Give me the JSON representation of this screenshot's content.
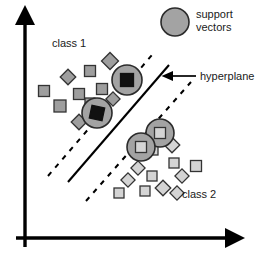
{
  "figure": {
    "background_color": "#ffffff",
    "width": 266,
    "height": 262
  },
  "labels": {
    "class1": "class 1",
    "class2": "class 2",
    "hyperplane": "hyperplane",
    "legend_line1": "support",
    "legend_line2": "vectors"
  },
  "colors": {
    "axis": "#000000",
    "hyperplane_line": "#000000",
    "margin_line": "#000000",
    "class1_fill": "#9e9e9e",
    "class1_stroke": "#333333",
    "class2_fill": "#d4d4d4",
    "class2_stroke": "#333333",
    "support_circle_fill": "#a3a3a3",
    "support_circle_stroke": "#2b2b2b",
    "support_square_class1_fill": "#111111",
    "text": "#1a1a1a"
  },
  "chart_data": {
    "type": "scatter",
    "xlabel": "",
    "ylabel": "",
    "grid": false,
    "legend_position": "top-right",
    "axes": {
      "x_axis": {
        "x1": 25,
        "y1": 238,
        "x2": 228,
        "y2": 238,
        "arrow": "right"
      },
      "y_axis": {
        "x1": 25,
        "y1": 238,
        "x2": 25,
        "y2": 22,
        "arrow": "up"
      }
    },
    "legend": [
      {
        "name": "support vectors",
        "marker": "circle",
        "fill": "#a3a3a3",
        "stroke": "#2b2b2b",
        "cx": 175,
        "cy": 22,
        "r": 14
      }
    ],
    "annotations": [
      {
        "name": "class1-label",
        "text": "class 1",
        "x": 52,
        "y": 47
      },
      {
        "name": "class2-label",
        "text": "class 2",
        "x": 182,
        "y": 198
      },
      {
        "name": "hyperplane-label",
        "text": "hyperplane",
        "x": 200,
        "y": 80
      },
      {
        "name": "hyperplane-arrow",
        "from_x": 196,
        "from_y": 76,
        "to_x": 170,
        "to_y": 76
      }
    ],
    "lines": [
      {
        "name": "hyperplane",
        "style": "solid",
        "x1": 68,
        "y1": 182,
        "x2": 169,
        "y2": 65
      },
      {
        "name": "margin-upper",
        "style": "dashed",
        "x1": 48,
        "y1": 176,
        "x2": 152,
        "y2": 55
      },
      {
        "name": "margin-lower",
        "style": "dashed",
        "x1": 86,
        "y1": 201,
        "x2": 191,
        "y2": 82
      }
    ],
    "series": [
      {
        "name": "class 1",
        "marker": "square",
        "fill": "#9e9e9e",
        "stroke": "#333333",
        "points": [
          {
            "x": 44,
            "y": 91,
            "size": 11,
            "rot": 0
          },
          {
            "x": 68,
            "y": 77,
            "size": 11,
            "rot": 45
          },
          {
            "x": 60,
            "y": 106,
            "size": 12,
            "rot": 0
          },
          {
            "x": 79,
            "y": 94,
            "size": 11,
            "rot": 0
          },
          {
            "x": 90,
            "y": 71,
            "size": 11,
            "rot": 0
          },
          {
            "x": 79,
            "y": 122,
            "size": 11,
            "rot": 45
          },
          {
            "x": 102,
            "y": 89,
            "size": 11,
            "rot": 0
          },
          {
            "x": 110,
            "y": 61,
            "size": 12,
            "rot": 45
          },
          {
            "x": 104,
            "y": 113,
            "size": 10,
            "rot": 45
          },
          {
            "x": 113,
            "y": 99,
            "size": 10,
            "rot": 45
          },
          {
            "x": 90,
            "y": 103,
            "size": 10,
            "rot": 0
          }
        ]
      },
      {
        "name": "class 1 support vectors",
        "marker": "square-in-circle",
        "fill": "#111111",
        "stroke": "#111111",
        "circle_fill": "#a3a3a3",
        "circle_stroke": "#2b2b2b",
        "points": [
          {
            "x": 127,
            "y": 80,
            "size": 13,
            "rot": 0,
            "r": 15
          },
          {
            "x": 97,
            "y": 113,
            "size": 13,
            "rot": 12,
            "r": 15
          }
        ]
      },
      {
        "name": "class 2",
        "marker": "square",
        "fill": "#d4d4d4",
        "stroke": "#333333",
        "points": [
          {
            "x": 153,
            "y": 150,
            "size": 10,
            "rot": 0
          },
          {
            "x": 172,
            "y": 145,
            "size": 11,
            "rot": 45
          },
          {
            "x": 174,
            "y": 163,
            "size": 10,
            "rot": 0
          },
          {
            "x": 138,
            "y": 168,
            "size": 10,
            "rot": 45
          },
          {
            "x": 152,
            "y": 176,
            "size": 10,
            "rot": 0
          },
          {
            "x": 128,
            "y": 180,
            "size": 10,
            "rot": 45
          },
          {
            "x": 163,
            "y": 188,
            "size": 11,
            "rot": 45
          },
          {
            "x": 145,
            "y": 191,
            "size": 10,
            "rot": 0
          },
          {
            "x": 182,
            "y": 176,
            "size": 10,
            "rot": 45
          },
          {
            "x": 196,
            "y": 166,
            "size": 11,
            "rot": 0
          },
          {
            "x": 119,
            "y": 193,
            "size": 10,
            "rot": 0
          },
          {
            "x": 177,
            "y": 193,
            "size": 10,
            "rot": 45
          }
        ]
      },
      {
        "name": "class 2 support vectors",
        "marker": "square-in-circle",
        "fill": "#d4d4d4",
        "stroke": "#333333",
        "circle_fill": "#a3a3a3",
        "circle_stroke": "#2b2b2b",
        "points": [
          {
            "x": 160,
            "y": 133,
            "size": 11,
            "rot": 0,
            "r": 14
          },
          {
            "x": 141,
            "y": 147,
            "size": 11,
            "rot": 0,
            "r": 14
          }
        ]
      }
    ]
  }
}
